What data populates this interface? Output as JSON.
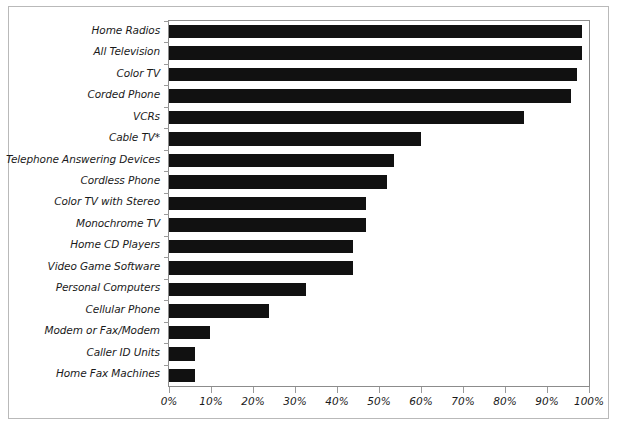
{
  "chart_data": {
    "type": "bar",
    "orientation": "horizontal",
    "title": "",
    "subtitle": "",
    "xlabel": "",
    "ylabel": "",
    "xlim": [
      0,
      100
    ],
    "x_tick_labels": [
      "0%",
      "10%",
      "20%",
      "30%",
      "40%",
      "50%",
      "60%",
      "70%",
      "80%",
      "90%",
      "100%"
    ],
    "x_tick_values": [
      0,
      10,
      20,
      30,
      40,
      50,
      60,
      70,
      80,
      90,
      100
    ],
    "grid": false,
    "legend": "none",
    "bar_color": "#111111",
    "axis_color": "#8c8c8c",
    "frame_color": "#b9b9b9",
    "categories": [
      "Home Radios",
      "All Television",
      "Color TV",
      "Corded Phone",
      "VCRs",
      "Cable TV*",
      "Telephone Answering Devices",
      "Cordless Phone",
      "Color TV with Stereo",
      "Monochrome TV",
      "Home CD Players",
      "Video Game Software",
      "Personal Computers",
      "Cellular Phone",
      "Modem or Fax/Modem",
      "Caller ID Units",
      "Home Fax Machines"
    ],
    "values": [
      98.3,
      98.3,
      97.2,
      95.8,
      84.5,
      60.0,
      53.5,
      52.0,
      47.0,
      47.0,
      43.8,
      43.8,
      32.7,
      23.7,
      9.8,
      6.2,
      6.2
    ],
    "annotations": [
      "* Cable TV value marked with an asterisk footnote"
    ]
  }
}
